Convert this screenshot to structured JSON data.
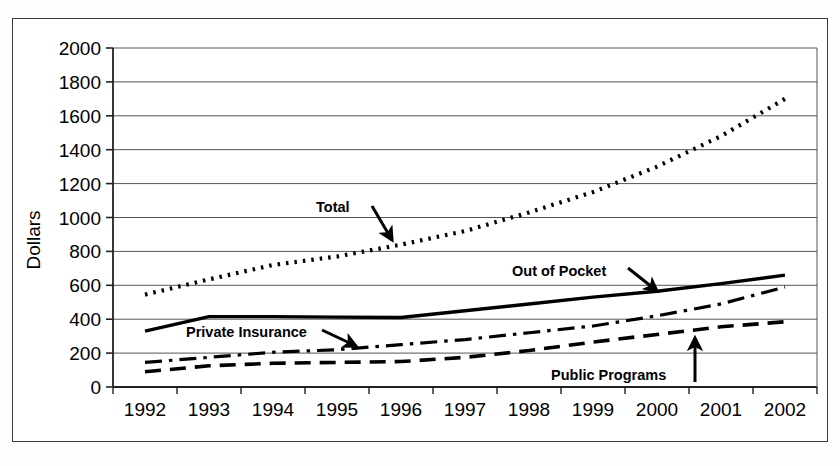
{
  "chart_data": {
    "type": "line",
    "title": "",
    "xlabel": "",
    "ylabel": "Dollars",
    "ylim": [
      0,
      2000
    ],
    "ytick_step": 200,
    "grid": true,
    "legend": "none (inline annotations with arrows)",
    "categories": [
      "1992",
      "1993",
      "1994",
      "1995",
      "1996",
      "1997",
      "1998",
      "1999",
      "2000",
      "2001",
      "2002"
    ],
    "yticks": [
      "0",
      "200",
      "400",
      "600",
      "800",
      "1000",
      "1200",
      "1400",
      "1600",
      "1800",
      "2000"
    ],
    "series": [
      {
        "name": "Total",
        "style": "dotted",
        "values": [
          545,
          635,
          720,
          770,
          840,
          920,
          1030,
          1150,
          1300,
          1480,
          1700
        ]
      },
      {
        "name": "Out of Pocket",
        "style": "solid",
        "values": [
          330,
          415,
          415,
          412,
          410,
          450,
          490,
          530,
          565,
          610,
          660
        ]
      },
      {
        "name": "Private Insurance",
        "style": "dash-dot",
        "values": [
          145,
          175,
          205,
          220,
          250,
          280,
          320,
          360,
          420,
          490,
          590
        ]
      },
      {
        "name": "Public Programs",
        "style": "dashed",
        "values": [
          90,
          125,
          140,
          145,
          150,
          175,
          215,
          265,
          310,
          355,
          385
        ]
      }
    ],
    "annotations": [
      {
        "label": "Total",
        "x": 316,
        "y": 212,
        "arrow_from": [
          372,
          206
        ],
        "arrow_to": [
          392,
          240
        ]
      },
      {
        "label": "Out of Pocket",
        "x": 512,
        "y": 276,
        "arrow_from": [
          628,
          268
        ],
        "arrow_to": [
          657,
          291
        ]
      },
      {
        "label": "Private Insurance",
        "x": 186,
        "y": 337,
        "arrow_from": [
          322,
          330
        ],
        "arrow_to": [
          356,
          346
        ]
      },
      {
        "label": "Public Programs",
        "x": 551,
        "y": 380,
        "arrow_from": [
          695,
          382
        ],
        "arrow_to": [
          695,
          338
        ]
      }
    ],
    "colors": {
      "line": "#000000",
      "grid": "#555555",
      "axis": "#222222",
      "background": "#ffffff",
      "frame": "#3a3a3a"
    }
  }
}
